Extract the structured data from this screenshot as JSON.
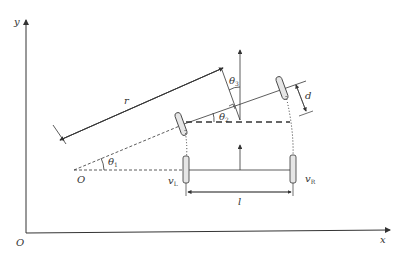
{
  "diagram": {
    "axes": {
      "x_label": "x",
      "y_label": "y",
      "origin_label": "O"
    },
    "labels": {
      "rotation_center": "O",
      "radius": "r",
      "theta1": "θ",
      "theta1_sub": "1",
      "theta2": "θ",
      "theta2_sub": "2",
      "theta3": "θ",
      "theta3_sub": "3",
      "wheel_offset": "d",
      "wheel_base": "l",
      "left_velocity": "v",
      "left_velocity_sub": "L",
      "right_velocity": "v",
      "right_velocity_sub": "R"
    },
    "colors": {
      "line": "#333333",
      "wheel_fill": "#e6e6e6"
    }
  }
}
